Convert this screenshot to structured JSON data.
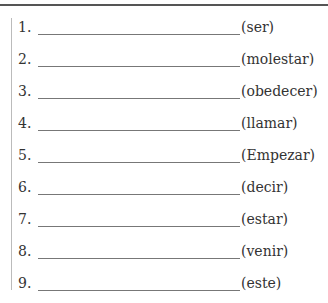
{
  "exercise": {
    "items": [
      {
        "number": "1.",
        "hint": "(ser)"
      },
      {
        "number": "2.",
        "hint": "(molestar)"
      },
      {
        "number": "3.",
        "hint": "(obedecer)"
      },
      {
        "number": "4.",
        "hint": "(llamar)"
      },
      {
        "number": "5.",
        "hint": "(Empezar)"
      },
      {
        "number": "6.",
        "hint": "(decir)"
      },
      {
        "number": "7.",
        "hint": "(estar)"
      },
      {
        "number": "8.",
        "hint": "(venir)"
      },
      {
        "number": "9.",
        "hint": "(este)"
      }
    ]
  }
}
